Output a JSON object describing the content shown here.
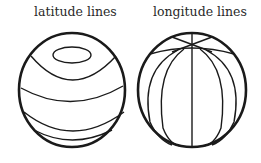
{
  "figure": {
    "panels": [
      {
        "id": "latitude",
        "label": "latitude lines",
        "line_type": "latitude",
        "line_count": 5,
        "description": "Sphere with horizontal parallel circles (latitude lines), including a small polar cap ellipse"
      },
      {
        "id": "longitude",
        "label": "longitude lines",
        "line_type": "longitude",
        "line_count": 6,
        "description": "Sphere with meridians (longitude lines) converging toward the top pole"
      }
    ]
  },
  "colors": {
    "stroke": "#1a1a1a",
    "background": "#ffffff",
    "text": "#2a2a2a"
  }
}
